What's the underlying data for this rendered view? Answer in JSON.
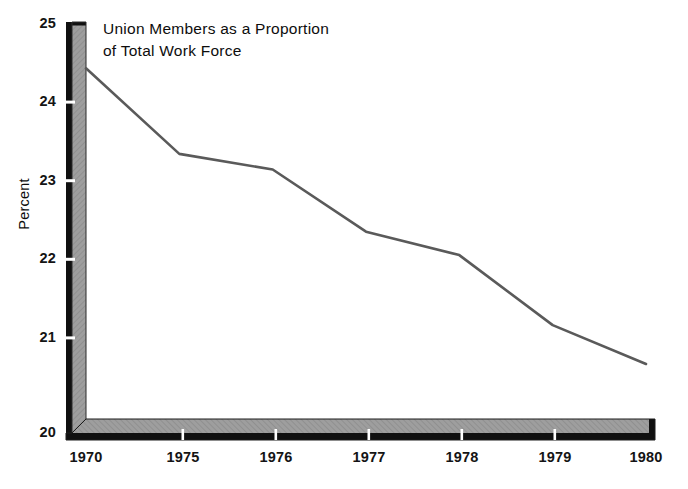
{
  "chart_data": {
    "type": "line",
    "title": "Union Members as a Proportion\nof Total Work Force",
    "xlabel": "",
    "ylabel": "Percent",
    "categories": [
      "1970",
      "1975",
      "1976",
      "1977",
      "1978",
      "1979",
      "1980"
    ],
    "x": [
      1970,
      1975,
      1976,
      1977,
      1978,
      1979,
      1980
    ],
    "values": [
      24.7,
      23.6,
      23.4,
      22.6,
      22.3,
      21.4,
      20.9
    ],
    "series": [
      {
        "name": "Union Members as a Proportion of Total Work Force",
        "values": [
          24.7,
          23.6,
          23.4,
          22.6,
          22.3,
          21.4,
          20.9
        ]
      }
    ],
    "ylim": [
      20,
      25
    ],
    "yticks": [
      20,
      21,
      22,
      23,
      24,
      25
    ],
    "ytick_labels": [
      "20",
      "21",
      "22",
      "23",
      "24",
      "25"
    ],
    "xtick_labels": [
      "1970",
      "1975",
      "1976",
      "1977",
      "1978",
      "1979",
      "1980"
    ],
    "grid": false,
    "legend": false,
    "legend_position": "none",
    "note": "X axis uses equal spacing per labelled category; the 1970-1975 interval spans five years while later intervals span one year each.",
    "colors": {
      "line": "#5a5a5a",
      "axis_face": "#9c9c9c",
      "axis_shadow": "#0f0f0f",
      "background": "#ffffff",
      "text": "#111111"
    }
  },
  "axis": {
    "y_label": "Percent",
    "y_ticks": [
      "25",
      "24",
      "23",
      "22",
      "21",
      "20"
    ],
    "x_ticks": [
      "1970",
      "1975",
      "1976",
      "1977",
      "1978",
      "1979",
      "1980"
    ]
  },
  "title": {
    "line1": "Union Members as a Proportion",
    "line2": "of Total Work Force",
    "full": "Union Members as a Proportion\nof Total Work Force"
  }
}
